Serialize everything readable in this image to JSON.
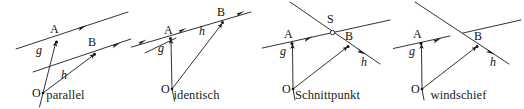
{
  "figure": {
    "stroke_color": "#1b1b1b",
    "label_color": "#111111",
    "background": "#ffffff"
  },
  "panels": [
    {
      "id": "parallel",
      "caption": "parallel",
      "labels": {
        "origin": "O",
        "point_a": "A",
        "point_b": "B",
        "line_g": "g",
        "line_h": "h"
      },
      "description": "Zwei echt parallele Geraden g und h mit Ortsvektoren OA und OB"
    },
    {
      "id": "identisch",
      "caption": "identisch",
      "labels": {
        "origin": "O",
        "point_a": "A",
        "point_b": "B",
        "line_g": "g",
        "line_h": "h"
      },
      "description": "Die Geraden g und h fallen zusammen, A und B liegen auf derselben Geraden"
    },
    {
      "id": "schnittpunkt",
      "caption": "Schnittpunkt",
      "labels": {
        "origin": "O",
        "point_a": "A",
        "point_b": "B",
        "line_g": "g",
        "line_h": "h",
        "intersection": "S"
      },
      "description": "Die Geraden g und h schneiden sich im Punkt S"
    },
    {
      "id": "windschief",
      "caption": "windschief",
      "labels": {
        "origin": "O",
        "point_a": "A",
        "point_b": "B",
        "line_g": "g",
        "line_h": "h"
      },
      "description": "Die Geraden g und h sind windschief, sie kreuzen sich ohne Schnittpunkt"
    }
  ]
}
